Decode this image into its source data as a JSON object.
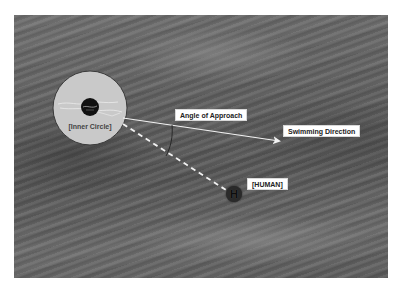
{
  "diagram": {
    "background": "grayscale water surface photograph with diagonal waves",
    "colors": {
      "inner_circle_fill": "#c9c9c9",
      "inner_circle_border": "#3a3a3a",
      "center_dot": "#111111",
      "arrow": "#f2f2f2",
      "dashed_line": "#f2f2f2",
      "arc": "#222222",
      "label_bg": "#ffffff",
      "human_marker": "#2a2a2a"
    },
    "labels": {
      "inner_circle": "[Inner Circle]",
      "angle_of_approach": "Angle of Approach",
      "swimming_direction": "Swimming Direction",
      "human": "[HUMAN]",
      "human_marker_glyph": "H"
    },
    "elements": {
      "inner_circle": {
        "cx": 90,
        "cy": 108,
        "r": 37
      },
      "center_dot": {
        "cx": 90,
        "cy": 108,
        "r": 9
      },
      "swimming_arrow": {
        "x1": 123,
        "y1": 118,
        "x2": 281,
        "y2": 141
      },
      "approach_line": {
        "x1": 123,
        "y1": 124,
        "x2": 226,
        "y2": 190,
        "style": "dashed"
      },
      "human": {
        "cx": 234,
        "cy": 194,
        "r": 8
      }
    }
  }
}
